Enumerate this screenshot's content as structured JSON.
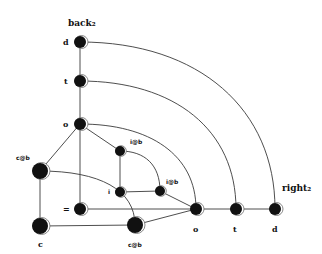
{
  "diagram": {
    "type": "graph",
    "title_labels": {
      "back": "back₂",
      "right": "right₂"
    },
    "nodes": [
      {
        "id": "back_d",
        "label": "d",
        "x": 80,
        "y": 42,
        "r": 6
      },
      {
        "id": "back_t",
        "label": "t",
        "x": 80,
        "y": 81,
        "r": 6
      },
      {
        "id": "back_o",
        "label": "o",
        "x": 80,
        "y": 124,
        "r": 6
      },
      {
        "id": "cb_left",
        "label": "c@b",
        "x": 40,
        "y": 171,
        "r": 8
      },
      {
        "id": "c",
        "label": "c",
        "x": 40,
        "y": 226,
        "r": 8
      },
      {
        "id": "eq",
        "label": "=",
        "x": 80,
        "y": 209,
        "r": 6
      },
      {
        "id": "ib_upper",
        "label": "i@b",
        "x": 120,
        "y": 151,
        "r": 5
      },
      {
        "id": "i",
        "label": "i",
        "x": 120,
        "y": 192,
        "r": 5
      },
      {
        "id": "ib_lower",
        "label": "i@b",
        "x": 160,
        "y": 191,
        "r": 5
      },
      {
        "id": "cb_bottom",
        "label": "c@b",
        "x": 135,
        "y": 225,
        "r": 8
      },
      {
        "id": "right_o",
        "label": "o",
        "x": 196,
        "y": 209,
        "r": 6
      },
      {
        "id": "right_t",
        "label": "t",
        "x": 236,
        "y": 209,
        "r": 6
      },
      {
        "id": "right_d",
        "label": "d",
        "x": 275,
        "y": 209,
        "r": 6
      }
    ],
    "edges": [
      [
        "back_d",
        "back_t"
      ],
      [
        "back_t",
        "back_o"
      ],
      [
        "back_o",
        "eq"
      ],
      [
        "back_o",
        "cb_left"
      ],
      [
        "back_o",
        "ib_upper"
      ],
      [
        "ib_upper",
        "i"
      ],
      [
        "i",
        "ib_lower"
      ],
      [
        "ib_upper",
        "ib_lower",
        "arc"
      ],
      [
        "ib_lower",
        "right_o"
      ],
      [
        "eq",
        "right_o"
      ],
      [
        "cb_bottom",
        "right_o"
      ],
      [
        "cb_left",
        "c"
      ],
      [
        "c",
        "cb_bottom"
      ],
      [
        "cb_left",
        "cb_bottom",
        "arc"
      ],
      [
        "back_d",
        "right_d",
        "arc"
      ],
      [
        "back_t",
        "right_t",
        "arc"
      ],
      [
        "back_o",
        "right_o",
        "arc"
      ],
      [
        "right_o",
        "right_t"
      ],
      [
        "right_t",
        "right_d"
      ]
    ]
  }
}
